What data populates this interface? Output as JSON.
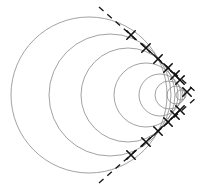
{
  "figure": {
    "width": 202,
    "height": 191,
    "background_color": "#ffffff"
  },
  "style": {
    "circle_stroke": "#8a8a8a",
    "circle_stroke_width": 0.8,
    "envelope_stroke": "#1a1a1a",
    "envelope_stroke_width": 1.4,
    "envelope_dash": "6,5",
    "marker_stroke": "#111111",
    "marker_stroke_width": 1.6,
    "marker_size": 4.2
  },
  "chart_data": {
    "type": "scatter",
    "xlabel": "",
    "ylabel": "",
    "xlim": [
      0,
      202
    ],
    "ylim": [
      0,
      191
    ],
    "grid": false,
    "legend": null,
    "apex": {
      "x": 190,
      "y": 95
    },
    "axis_of_symmetry_y": 95,
    "half_angle_deg": 34,
    "circles": [
      {
        "cx": 89,
        "cy": 95,
        "r": 78
      },
      {
        "cx": 110,
        "cy": 95,
        "r": 61
      },
      {
        "cx": 128,
        "cy": 95,
        "r": 47
      },
      {
        "cx": 146,
        "cy": 95,
        "r": 32
      },
      {
        "cx": 160,
        "cy": 95,
        "r": 21
      },
      {
        "cx": 169,
        "cy": 95,
        "r": 14
      },
      {
        "cx": 176,
        "cy": 95,
        "r": 9
      },
      {
        "cx": 181,
        "cy": 95,
        "r": 5
      }
    ],
    "envelope_lines": [
      {
        "name": "upper-tangent",
        "x1": 99,
        "y1": 7,
        "x2": 196,
        "y2": 92
      },
      {
        "name": "lower-tangent",
        "x1": 99,
        "y1": 183,
        "x2": 196,
        "y2": 98
      }
    ],
    "tangent_markers": [
      {
        "x": 131,
        "y": 35
      },
      {
        "x": 146,
        "y": 48
      },
      {
        "x": 158,
        "y": 59
      },
      {
        "x": 168,
        "y": 68
      },
      {
        "x": 175,
        "y": 75
      },
      {
        "x": 180,
        "y": 80
      },
      {
        "x": 187,
        "y": 92
      },
      {
        "x": 131,
        "y": 155
      },
      {
        "x": 146,
        "y": 142
      },
      {
        "x": 158,
        "y": 131
      },
      {
        "x": 168,
        "y": 122
      },
      {
        "x": 175,
        "y": 115
      },
      {
        "x": 180,
        "y": 110
      }
    ]
  }
}
